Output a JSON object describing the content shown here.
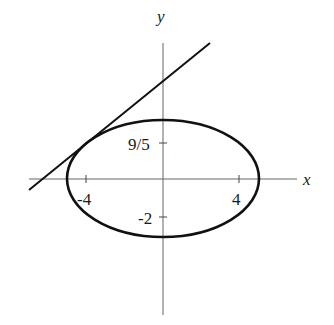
{
  "diagram": {
    "type": "ellipse-with-tangent-line",
    "axes": {
      "x_label": "x",
      "y_label": "y"
    },
    "ticks": {
      "x": [
        {
          "value": -4,
          "label": "-4"
        },
        {
          "value": 4,
          "label": "4"
        }
      ],
      "y": [
        {
          "value": 1.8,
          "label": "9/5"
        },
        {
          "value": -2,
          "label": "-2"
        }
      ]
    },
    "curves": [
      {
        "name": "ellipse",
        "description": "ellipse centered near origin, wider than tall"
      },
      {
        "name": "tangent-line",
        "description": "line tangent to ellipse at upper-left, positive slope"
      }
    ],
    "colors": {
      "stroke": "#111111",
      "axis": "#555555",
      "background": "#ffffff"
    }
  }
}
